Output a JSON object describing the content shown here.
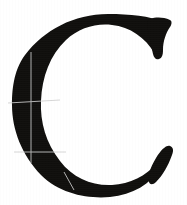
{
  "image": {
    "kind": "glyph-specimen",
    "description": "Scanned serif capital letter C with faint white construction hairlines",
    "width": 187,
    "height": 205,
    "background_color": "#ffffff"
  },
  "glyph": {
    "character": "C",
    "name": "latin-capital-letter-c",
    "style": "didone-high-contrast-serif",
    "fill_color": "#100f0d",
    "bounds": {
      "left": 12,
      "top": 14,
      "right": 176,
      "bottom": 198
    },
    "stroke_weights": {
      "thick_left_stem": 38,
      "thin_top_arc": 12,
      "thin_bottom_arc": 15
    },
    "terminals": [
      {
        "name": "top-right-beak-serif",
        "x": 160,
        "y": 30
      },
      {
        "name": "bottom-right-wedge-serif",
        "x": 158,
        "y": 170
      }
    ]
  },
  "guides": {
    "color": "#cfcfcf",
    "label": "construction hairlines",
    "vertical": [
      {
        "name": "stem-axis-vertical",
        "x": 31,
        "y1": 52,
        "y2": 163
      }
    ],
    "horizontal": [
      {
        "name": "upper-registration-horizontal",
        "x1": 8,
        "x2": 60,
        "y1": 103,
        "y2": 100
      },
      {
        "name": "lower-registration-horizontal",
        "x1": 14,
        "x2": 66,
        "y1": 152,
        "y2": 152
      }
    ],
    "diagonal": [
      {
        "name": "lower-arc-section-hairline",
        "x1": 64,
        "y1": 172,
        "x2": 74,
        "y2": 190
      }
    ]
  }
}
